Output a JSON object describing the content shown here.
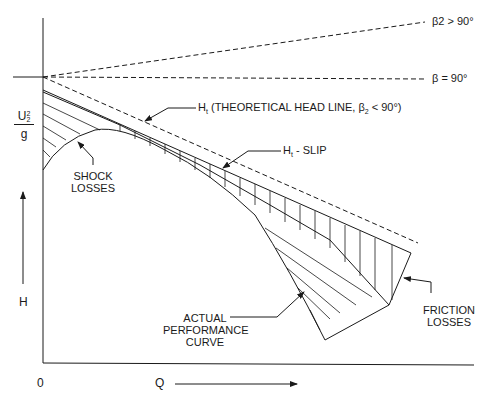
{
  "figure": {
    "type": "pump-performance-diagram",
    "axes": {
      "x_label": "Q",
      "y_label": "H",
      "origin_label": "0",
      "y_ref_label_num": "U",
      "y_ref_label_sup": "2",
      "y_ref_label_sub": "2",
      "y_ref_label_den": "g"
    },
    "lines": {
      "beta_gt_90": "β2 > 90°",
      "beta_eq_90": "β = 90°",
      "theoretical_prefix": "H",
      "theoretical_sub": "t",
      "theoretical_text": " (THEORETICAL HEAD LINE, β",
      "theoretical_beta_sub": "2",
      "theoretical_suffix": " < 90°)",
      "slip_prefix": "H",
      "slip_sub": "t",
      "slip_text": " - SLIP"
    },
    "annotations": {
      "shock_1": "SHOCK",
      "shock_2": "LOSSES",
      "actual_1": "ACTUAL",
      "actual_2": "PERFORMANCE",
      "actual_3": "CURVE",
      "friction_1": "FRICTION",
      "friction_2": "LOSSES"
    },
    "colors": {
      "ink": "#1a1a1a",
      "background": "#ffffff"
    }
  }
}
